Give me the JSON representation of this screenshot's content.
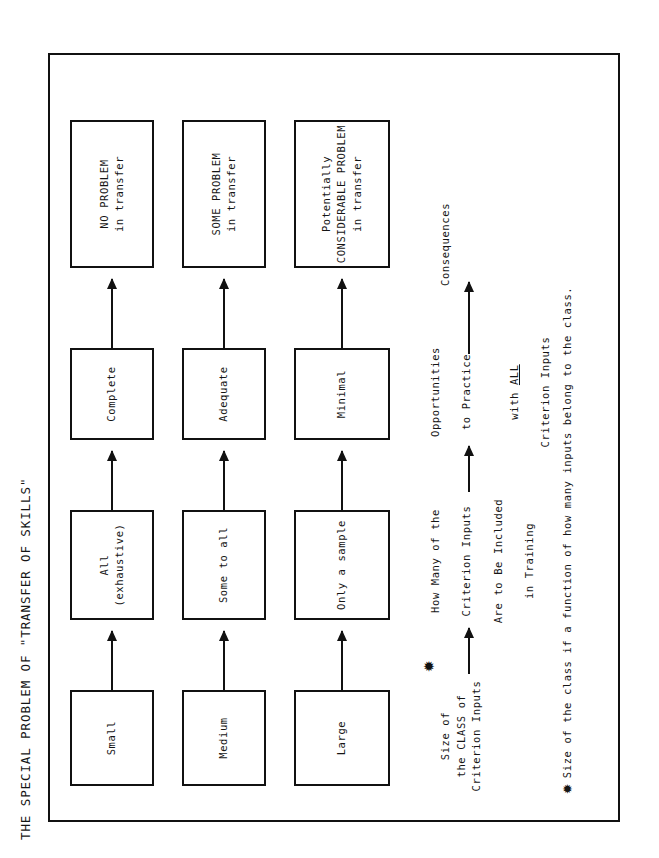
{
  "title": "THE SPECIAL PROBLEM OF \"TRANSFER OF SKILLS\"",
  "headers": {
    "col1": "Size of\nthe CLASS of\nCriterion Inputs",
    "col2_line1": "How Many of the",
    "col2_line2": "Criterion Inputs",
    "col2_line3": "Are to Be Included",
    "col2_line4": "in Training",
    "col3_line1": "Opportunities",
    "col3_line2": "to Practice",
    "col3_line3_pre": "with ",
    "col3_line3_em": "ALL",
    "col3_line4": "Criterion Inputs",
    "col4": "Consequences"
  },
  "star_glyph": "✹",
  "rows": [
    {
      "class_size": "Small",
      "inputs_included": "All\n(exhaustive)",
      "practice": "Complete",
      "consequence": "NO PROBLEM\nin transfer"
    },
    {
      "class_size": "Medium",
      "inputs_included": "Some to all",
      "practice": "Adequate",
      "consequence": "SOME PROBLEM\nin transfer"
    },
    {
      "class_size": "Large",
      "inputs_included": "Only a sample",
      "practice": "Minimal",
      "consequence": "Potentially\nCONSIDERABLE PROBLEM\nin transfer"
    }
  ],
  "footnote": "Size of the class if a function of how many inputs belong to the class.",
  "colors": {
    "ink": "#151515",
    "line": "#111111",
    "paper": "#ffffff"
  }
}
